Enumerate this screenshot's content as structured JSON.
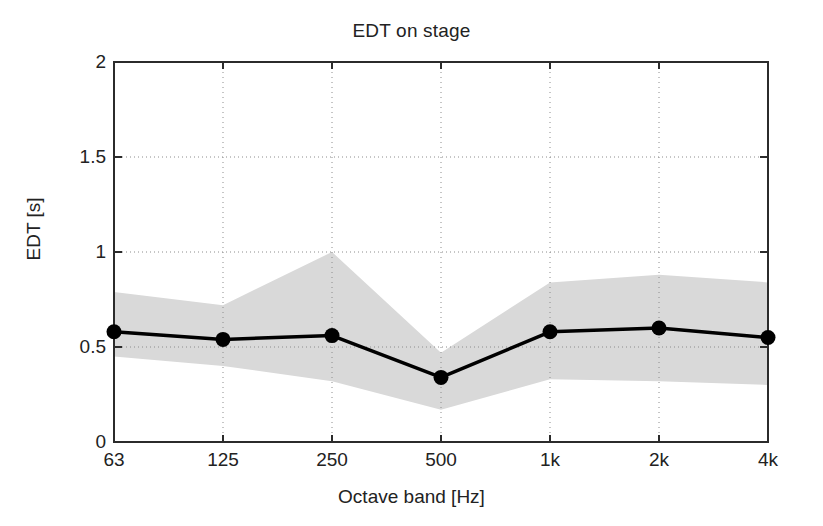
{
  "chart_data": {
    "type": "line",
    "title": "EDT on stage",
    "xlabel": "Octave band [Hz]",
    "ylabel": "EDT [s]",
    "categories": [
      "63",
      "125",
      "250",
      "500",
      "1k",
      "2k",
      "4k"
    ],
    "values": [
      0.58,
      0.54,
      0.56,
      0.34,
      0.58,
      0.6,
      0.55
    ],
    "series": [
      {
        "name": "EDT mean",
        "values": [
          0.58,
          0.54,
          0.56,
          0.34,
          0.58,
          0.6,
          0.55
        ]
      },
      {
        "name": "band upper",
        "values": [
          0.79,
          0.72,
          1.0,
          0.47,
          0.84,
          0.88,
          0.84
        ]
      },
      {
        "name": "band lower",
        "values": [
          0.45,
          0.4,
          0.32,
          0.17,
          0.33,
          0.32,
          0.3
        ]
      }
    ],
    "ylim": [
      0,
      2
    ],
    "ytick_labels": [
      "0",
      "0.5",
      "1",
      "1.5",
      "2"
    ],
    "ytick_values": [
      0,
      0.5,
      1,
      1.5,
      2
    ],
    "grid": "dotted",
    "legend": "none",
    "marker": "filled-circle",
    "band_color": "#d9d9d9",
    "line_color": "#000000"
  },
  "style": {
    "axis_color": "#2b2b2b",
    "grid_color": "#8c8c8c",
    "background": "#ffffff",
    "text_color": "#222222"
  }
}
